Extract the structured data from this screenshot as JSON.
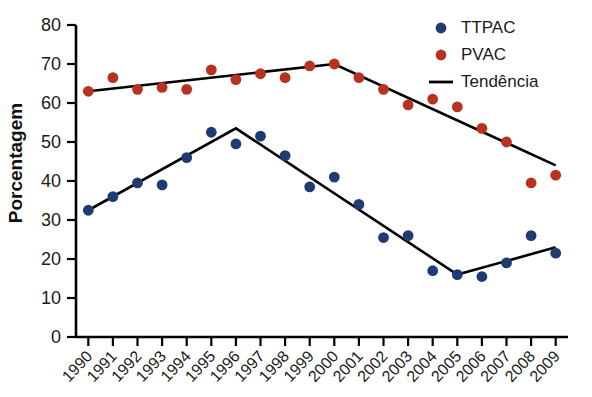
{
  "chart_data": {
    "type": "scatter",
    "title": "",
    "xlabel": "",
    "ylabel": "Porcentagem",
    "ylim": [
      0,
      80
    ],
    "ytick_values": [
      0,
      10,
      20,
      30,
      40,
      50,
      60,
      70,
      80
    ],
    "grid": false,
    "legend_position": "top-right",
    "categories": [
      "1990",
      "1991",
      "1992",
      "1993",
      "1994",
      "1995",
      "1996",
      "1997",
      "1998",
      "1999",
      "2000",
      "2001",
      "2002",
      "2003",
      "2004",
      "2005",
      "2006",
      "2007",
      "2008",
      "2009"
    ],
    "series": [
      {
        "name": "TTPAC",
        "kind": "points",
        "color": "#1f3b73",
        "values": [
          32.5,
          36.0,
          39.5,
          39.0,
          46.0,
          52.5,
          49.5,
          51.5,
          46.5,
          38.5,
          41.0,
          34.0,
          25.5,
          26.0,
          17.0,
          16.0,
          15.5,
          19.0,
          26.0,
          21.5
        ]
      },
      {
        "name": "PVAC",
        "kind": "points",
        "color": "#b8321f",
        "values": [
          63.0,
          66.5,
          63.5,
          64.0,
          63.5,
          68.5,
          66.0,
          67.5,
          66.5,
          69.5,
          70.0,
          66.5,
          63.5,
          59.5,
          61.0,
          59.0,
          53.5,
          50.0,
          39.5,
          41.5
        ]
      },
      {
        "name": "Tendência",
        "kind": "line",
        "color": "#000000",
        "segments": [
          {
            "label": "PVAC trend",
            "points": [
              [
                1990,
                63.0
              ],
              [
                2000,
                70.0
              ],
              [
                2009,
                44.0
              ]
            ]
          },
          {
            "label": "TTPAC trend",
            "points": [
              [
                1990,
                32.5
              ],
              [
                1996,
                53.5
              ],
              [
                2005,
                16.0
              ],
              [
                2009,
                23.0
              ]
            ]
          }
        ]
      }
    ],
    "legend": [
      {
        "label": "TTPAC",
        "marker": "circle",
        "color": "#1f3b73"
      },
      {
        "label": "PVAC",
        "marker": "circle",
        "color": "#b8321f"
      },
      {
        "label": "Tendência",
        "marker": "line",
        "color": "#000000"
      }
    ]
  }
}
